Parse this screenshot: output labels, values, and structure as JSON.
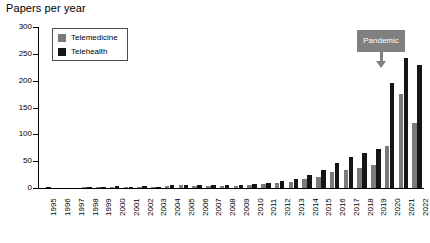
{
  "chart_data": {
    "type": "bar",
    "title": "Papers per year",
    "xlabel": "",
    "ylabel": "",
    "ylim": [
      0,
      300
    ],
    "yticks": [
      0,
      50,
      100,
      150,
      200,
      250,
      300
    ],
    "grid": false,
    "legend_position": "top-left",
    "categories": [
      "1995",
      "1996",
      "1997",
      "1998",
      "1999",
      "2000",
      "2001",
      "2002",
      "2003",
      "2004",
      "2005",
      "2006",
      "2007",
      "2008",
      "2009",
      "2010",
      "2011",
      "2012",
      "2013",
      "2014",
      "2015",
      "2016",
      "2017",
      "2018",
      "2019",
      "2020",
      "2021",
      "2022"
    ],
    "series": [
      {
        "name": "Telemedicine",
        "color": "#7a7a7a",
        "values": [
          0,
          0,
          0,
          1,
          1,
          2,
          1,
          2,
          1,
          4,
          5,
          4,
          4,
          4,
          4,
          5,
          7,
          9,
          11,
          16,
          21,
          29,
          33,
          37,
          43,
          78,
          175,
          122
        ]
      },
      {
        "name": "Telehealth",
        "color": "#151515",
        "values": [
          1,
          0,
          0,
          2,
          2,
          3,
          2,
          3,
          1,
          5,
          6,
          5,
          5,
          5,
          5,
          7,
          9,
          13,
          17,
          24,
          34,
          46,
          57,
          66,
          73,
          196,
          243,
          229
        ]
      }
    ],
    "annotations": [
      {
        "label": "Pandemic",
        "points_to_category": "2020",
        "box_color": "#808080",
        "text_color": "#ffffff"
      }
    ]
  },
  "legend": {
    "items": [
      {
        "label": "Telemedicine",
        "color": "#7a7a7a"
      },
      {
        "label": "Telehealth",
        "color": "#151515"
      }
    ]
  }
}
